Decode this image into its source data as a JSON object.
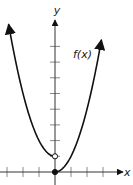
{
  "chart_data": {
    "type": "line",
    "title": "",
    "xlabel": "x",
    "ylabel": "y",
    "function_label": "f(x)",
    "xlim": [
      -3.4,
      4.3
    ],
    "ylim": [
      -0.8,
      10.8
    ],
    "x_ticks": [
      -3,
      -2,
      -1,
      1,
      2,
      3
    ],
    "y_ticks": [
      1,
      2,
      3,
      4,
      5,
      6,
      7,
      8
    ],
    "grid": false,
    "series": [
      {
        "name": "left piece",
        "formula": "x^2 + 1",
        "domain": [
          -2.9,
          0
        ],
        "endpoint": {
          "x": 0,
          "y": 1,
          "style": "open"
        }
      },
      {
        "name": "right piece",
        "formula": "x^2",
        "domain": [
          0,
          2.9
        ],
        "endpoint": {
          "x": 0,
          "y": 0,
          "style": "closed"
        }
      }
    ],
    "colors": {
      "curve": "#111111",
      "axis": "#333333",
      "ticks": "#888888"
    }
  }
}
